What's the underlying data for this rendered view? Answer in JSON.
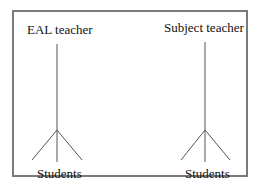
{
  "diagram": {
    "groups": [
      {
        "teacher_label": "EAL teacher",
        "students_label": "Students"
      },
      {
        "teacher_label": "Subject teacher",
        "students_label": "Students"
      }
    ],
    "colors": {
      "border": "#7a7a7a",
      "lines": "#555555",
      "text": "#111111"
    }
  }
}
